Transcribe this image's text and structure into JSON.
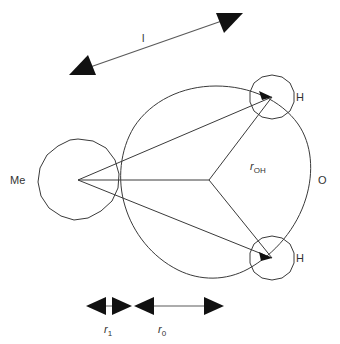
{
  "figure": {
    "background_color": "#ffffff",
    "stroke_color": "#3a3a3a",
    "arrow_color": "#111111",
    "width": 340,
    "height": 344
  },
  "atoms": [
    {
      "id": "me",
      "label": "Me",
      "label_x": 10,
      "label_y": 184,
      "center_x": 78,
      "center_y": 180,
      "radius": 41
    },
    {
      "id": "o",
      "label": "O",
      "label_x": 318,
      "label_y": 184,
      "center_x": 216,
      "center_y": 181,
      "radius": 95
    },
    {
      "id": "h-top",
      "label": "H",
      "label_x": 296,
      "label_y": 101,
      "center_x": 272,
      "center_y": 97,
      "radius": 22
    },
    {
      "id": "h-bottom",
      "label": "H",
      "label_x": 296,
      "label_y": 262,
      "center_x": 272,
      "center_y": 258,
      "radius": 22
    }
  ],
  "bonds": {
    "me_to_o_center": {
      "x1": 78,
      "y1": 180,
      "x2": 209,
      "y2": 180
    },
    "me_to_h_top": {
      "x1": 78,
      "y1": 180,
      "x2": 272,
      "y2": 97
    },
    "me_to_h_bottom": {
      "x1": 78,
      "y1": 180,
      "x2": 272,
      "y2": 258
    },
    "o_to_h_top": {
      "x1": 209,
      "y1": 180,
      "x2": 272,
      "y2": 97
    },
    "o_to_h_bottom": {
      "x1": 209,
      "y1": 180,
      "x2": 272,
      "y2": 258
    }
  },
  "annotations": {
    "roh": {
      "symbol": "r",
      "subscript": "OH",
      "x": 250,
      "y": 170
    },
    "l_arrow": {
      "label": "l",
      "label_x": 142,
      "label_y": 42,
      "from_x": 72,
      "from_y": 74,
      "to_x": 240,
      "to_y": 14
    },
    "r1_dimension": {
      "symbol": "r",
      "subscript": "1",
      "label_x": 104,
      "label_y": 333,
      "left_x": 88,
      "right_x": 130,
      "y": 306
    },
    "r0_dimension": {
      "symbol": "r",
      "subscript": "0",
      "label_x": 158,
      "label_y": 333,
      "left_x": 133,
      "right_x": 222,
      "y": 306
    }
  }
}
